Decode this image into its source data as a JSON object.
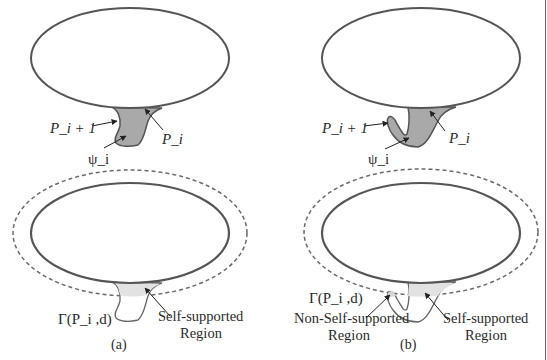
{
  "colors": {
    "outline": "#555555",
    "fill_psi": "#a9a9a9",
    "fill_light": "#e2e2e2",
    "dashed": "#6a6a6a",
    "text": "#2a2a2a"
  },
  "panel_a": {
    "top": {
      "label_p_next": "P_i + 1",
      "label_p_i": "P_i",
      "label_psi": "ψ_i"
    },
    "bottom": {
      "label_gamma": "Γ(P_i ,d)",
      "label_self_line1": "Self-supported",
      "label_self_line2": "Region"
    },
    "caption": "(a)"
  },
  "panel_b": {
    "top": {
      "label_p_next": "P_i + 1",
      "label_p_i": "P_i",
      "label_psi": "ψ_i"
    },
    "bottom": {
      "label_gamma": "Γ(P_i ,d)",
      "label_nonself_line1": "Non-Self-supported",
      "label_nonself_line2": "Region",
      "label_self_line1": "Self-supported",
      "label_self_line2": "Region"
    },
    "caption": "(b)"
  }
}
